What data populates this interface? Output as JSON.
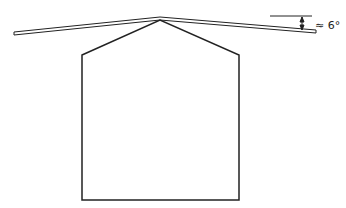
{
  "diagram": {
    "angle_label": "≈ 6°",
    "colors": {
      "stroke": "#222222",
      "background": "#ffffff"
    }
  }
}
